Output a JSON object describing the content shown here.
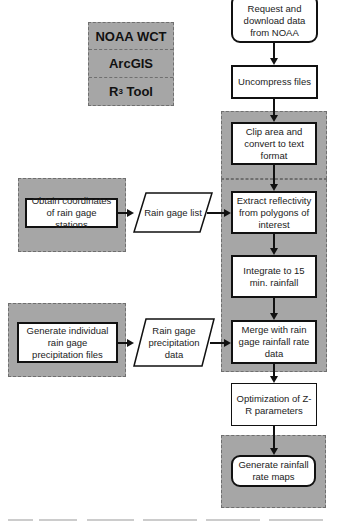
{
  "legend": {
    "items": [
      {
        "label": "NOAA WCT"
      },
      {
        "label": "ArcGIS"
      },
      {
        "label": "R",
        "superscript": "3",
        "suffix": " Tool"
      }
    ],
    "group_color": "#a6a6a6"
  },
  "flow": {
    "main": [
      {
        "id": "request",
        "label": "Request and download data from NOAA",
        "shape": "rounded"
      },
      {
        "id": "uncompress",
        "label": "Uncompress files",
        "shape": "rect"
      },
      {
        "id": "clip",
        "label": "Clip area and convert to text format",
        "shape": "rect",
        "group": "NOAA WCT"
      },
      {
        "id": "extract",
        "label": "Extract reflectivity from polygons of interest",
        "shape": "rect",
        "group": "ArcGIS"
      },
      {
        "id": "integrate",
        "label": "Integrate to 15 min. rainfall",
        "shape": "rect",
        "group": "ArcGIS"
      },
      {
        "id": "merge",
        "label": "Merge with rain gage rainfall rate data",
        "shape": "rect",
        "group": "ArcGIS"
      },
      {
        "id": "optimize",
        "label": "Optimization of Z-R parameters",
        "shape": "rect"
      },
      {
        "id": "generate_maps",
        "label": "Generate rainfall rate maps",
        "shape": "rounded",
        "group": "R3 Tool"
      }
    ],
    "side": [
      {
        "id": "obtain",
        "label": "Obtain coordinates of rain gage stations",
        "shape": "rect",
        "group": "ArcGIS"
      },
      {
        "id": "rain_gage_list",
        "label": "Rain gage list",
        "shape": "parallelogram"
      },
      {
        "id": "gen_individual",
        "label": "Generate individual rain gage precipitation files",
        "shape": "rect",
        "group": "R3 Tool"
      },
      {
        "id": "rain_gage_precip",
        "label": "Rain gage precipitation data",
        "shape": "parallelogram"
      }
    ],
    "edges": [
      [
        "request",
        "uncompress"
      ],
      [
        "uncompress",
        "clip"
      ],
      [
        "clip",
        "extract"
      ],
      [
        "extract",
        "integrate"
      ],
      [
        "integrate",
        "merge"
      ],
      [
        "merge",
        "optimize"
      ],
      [
        "optimize",
        "generate_maps"
      ],
      [
        "obtain",
        "rain_gage_list"
      ],
      [
        "rain_gage_list",
        "extract"
      ],
      [
        "gen_individual",
        "rain_gage_precip"
      ],
      [
        "rain_gage_precip",
        "merge"
      ]
    ]
  }
}
